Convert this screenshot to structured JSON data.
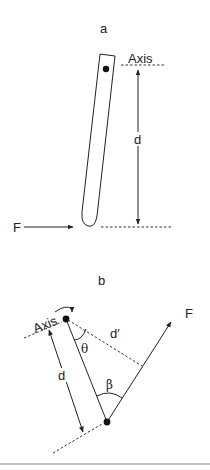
{
  "panels": {
    "a": {
      "label": "a",
      "axis_label": "Axis",
      "distance_label": "d",
      "force_label": "F"
    },
    "b": {
      "label": "b",
      "axis_label": "Axis",
      "distance_label": "d",
      "perpendicular_distance_label": "d′",
      "force_label": "F",
      "angle_theta_label": "θ",
      "angle_beta_label": "β"
    }
  },
  "colors": {
    "stroke": "#222222",
    "background": "#ffffff",
    "separator": "#888888"
  }
}
